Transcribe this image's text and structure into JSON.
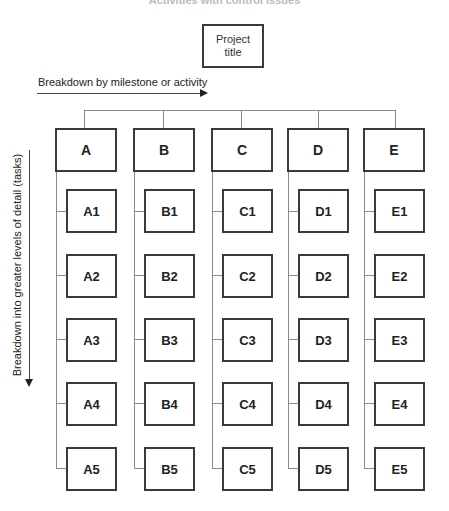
{
  "diagram": {
    "top_caption_partial": "Activities with control issues",
    "root": {
      "label_line1": "Project",
      "label_line2": "title"
    },
    "horizontal_axis_label": "Breakdown by milestone or activity",
    "vertical_axis_label": "Breakdown into greater levels of detail (tasks)",
    "columns": [
      {
        "label": "A",
        "tasks": [
          "A1",
          "A2",
          "A3",
          "A4",
          "A5"
        ]
      },
      {
        "label": "B",
        "tasks": [
          "B1",
          "B2",
          "B3",
          "B4",
          "B5"
        ]
      },
      {
        "label": "C",
        "tasks": [
          "C1",
          "C2",
          "C3",
          "C4",
          "C5"
        ]
      },
      {
        "label": "D",
        "tasks": [
          "D1",
          "D2",
          "D3",
          "D4",
          "D5"
        ]
      },
      {
        "label": "E",
        "tasks": [
          "E1",
          "E2",
          "E3",
          "E4",
          "E5"
        ]
      }
    ],
    "colors": {
      "box_border": "#3a3a3a",
      "connector": "#8a8a8a",
      "text": "#222222"
    }
  }
}
